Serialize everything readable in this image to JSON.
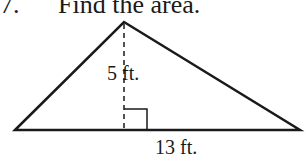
{
  "problem": {
    "number": "7.",
    "prompt": "Find the area."
  },
  "figure": {
    "shape": "triangle",
    "height_label": "5 ft.",
    "base_label": "13 ft.",
    "right_angle_marker": true,
    "height_line_style": "dashed",
    "stroke_color": "#1a1a1a"
  }
}
